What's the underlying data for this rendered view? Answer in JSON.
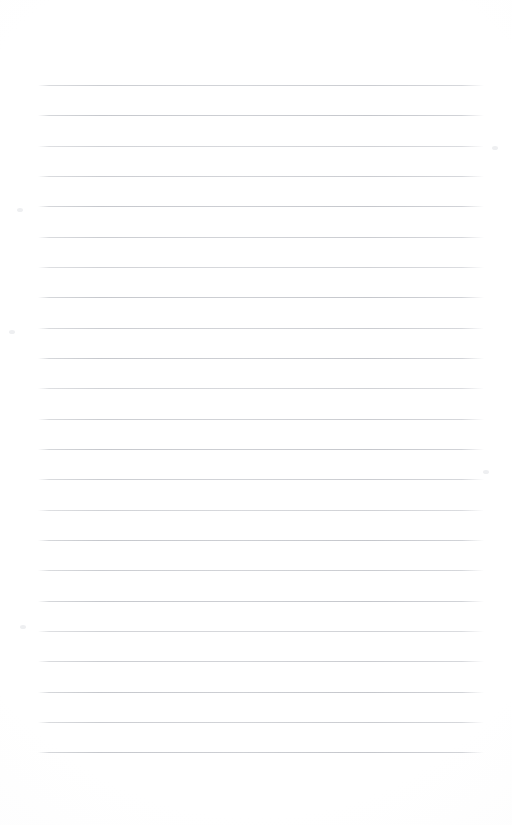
{
  "page": {
    "kind": "scanned-blank-ruled-notepad-page",
    "width": 512,
    "height": 825,
    "background_color": "#ffffff",
    "content_text": "",
    "has_handwriting": false,
    "has_printed_text": false,
    "orientation": "portrait"
  },
  "rules": {
    "count": 23,
    "color": "#c6c8cd",
    "thickness_px": 1,
    "first_line_y": 85,
    "spacing_px": 30.3,
    "left_x": 38,
    "right_x": 484,
    "line_length_px": 446,
    "y_positions": [
      85,
      115,
      146,
      176,
      206,
      237,
      267,
      297,
      328,
      358,
      388,
      419,
      449,
      479,
      510,
      540,
      570,
      601,
      631,
      661,
      692,
      722,
      752
    ],
    "densities": [
      "mid",
      "full",
      "dim",
      "mid",
      "full",
      "mid",
      "dim",
      "full",
      "mid",
      "full",
      "dim",
      "mid",
      "full",
      "mid",
      "dim",
      "full",
      "mid",
      "full",
      "dim",
      "mid",
      "full",
      "mid",
      "full"
    ]
  },
  "margins": {
    "top_px": 85,
    "bottom_px": 73,
    "left_px": 38,
    "right_px": 28
  },
  "artifacts": {
    "specks": [
      {
        "x": 17,
        "y": 208
      },
      {
        "x": 9,
        "y": 330
      },
      {
        "x": 492,
        "y": 146
      },
      {
        "x": 20,
        "y": 625
      },
      {
        "x": 483,
        "y": 470
      }
    ]
  }
}
